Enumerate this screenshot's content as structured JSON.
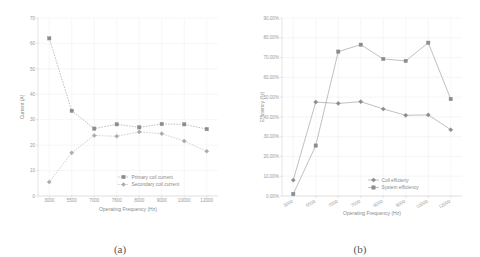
{
  "figure": {
    "panel_a_label": "(a)",
    "panel_b_label": "(b)"
  },
  "chart_data": [
    {
      "type": "line",
      "panel": "(a)",
      "title": "",
      "xlabel": "Operating Frequency (Hz)",
      "ylabel": "Current (A)",
      "categories": [
        "3000",
        "5500",
        "7000",
        "7600",
        "8000",
        "9000",
        "10000",
        "12000"
      ],
      "ylim": [
        0,
        70
      ],
      "yticks": [
        "0",
        "10",
        "20",
        "30",
        "40",
        "50",
        "60",
        "70"
      ],
      "ytick_values": [
        0,
        10,
        20,
        30,
        40,
        50,
        60,
        70
      ],
      "grid": true,
      "legend_position": "inside-bottom-right",
      "series": [
        {
          "name": "Primary coil current",
          "values": [
            62.0,
            33.5,
            26.5,
            28.2,
            27.0,
            28.3,
            28.2,
            26.3
          ],
          "color": "#8c8c8c",
          "marker": "square"
        },
        {
          "name": "Secondary coil current",
          "values": [
            5.5,
            17.0,
            23.8,
            23.5,
            25.2,
            24.5,
            21.6,
            17.6
          ],
          "color": "#aaaaaa",
          "marker": "diamond"
        }
      ]
    },
    {
      "type": "line",
      "panel": "(b)",
      "title": "",
      "xlabel": "Operating Frequency (Hz)",
      "ylabel": "Efficiency (%)",
      "categories": [
        "3000",
        "5500",
        "7000",
        "7600",
        "8000",
        "9000",
        "10000",
        "12000"
      ],
      "ylim": [
        0,
        90
      ],
      "yticks": [
        "0.00%",
        "10.00%",
        "20.00%",
        "30.00%",
        "40.00%",
        "50.00%",
        "60.00%",
        "70.00%",
        "80.00%",
        "90.00%"
      ],
      "ytick_values": [
        0,
        10,
        20,
        30,
        40,
        50,
        60,
        70,
        80,
        90
      ],
      "grid": true,
      "legend_position": "inside-bottom-right",
      "series": [
        {
          "name": "Coil efficieny",
          "values": [
            8.0,
            47.5,
            46.8,
            47.7,
            44.0,
            40.8,
            41.0,
            33.5
          ],
          "color": "#8c8c8c",
          "marker": "diamond"
        },
        {
          "name": "System efficiency",
          "values": [
            1.0,
            25.5,
            73.0,
            76.5,
            69.3,
            68.3,
            77.5,
            49.0
          ],
          "color": "#8c8c8c",
          "marker": "square"
        }
      ]
    }
  ]
}
